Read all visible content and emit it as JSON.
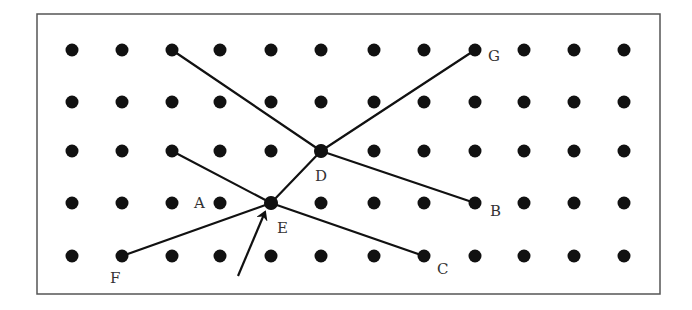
{
  "diagram": {
    "title": "",
    "colors": {
      "ink": "#111111",
      "frame": "#555555",
      "label": "#333333",
      "background": "#ffffff"
    },
    "frame": {
      "x": 37,
      "y": 14,
      "width": 623,
      "height": 280
    },
    "grid": {
      "columns_x": [
        72,
        122,
        172,
        220,
        271,
        321,
        374,
        424,
        475,
        524,
        574,
        624
      ],
      "rows_y": [
        50,
        102,
        151,
        203,
        256
      ],
      "dot_radius": 6.5
    },
    "junction_points": [
      {
        "name": "D",
        "x": 321,
        "y": 151
      },
      {
        "name": "E",
        "x": 271,
        "y": 203
      }
    ],
    "segments": [
      {
        "from": [
          172,
          50
        ],
        "to": [
          321,
          151
        ]
      },
      {
        "from": [
          475,
          50
        ],
        "to": [
          321,
          151
        ]
      },
      {
        "from": [
          321,
          151
        ],
        "to": [
          271,
          203
        ]
      },
      {
        "from": [
          321,
          151
        ],
        "to": [
          475,
          203
        ]
      },
      {
        "from": [
          172,
          151
        ],
        "to": [
          271,
          203
        ]
      },
      {
        "from": [
          122,
          256
        ],
        "to": [
          271,
          203
        ]
      },
      {
        "from": [
          271,
          203
        ],
        "to": [
          424,
          256
        ]
      }
    ],
    "arrow": {
      "from": [
        238,
        276
      ],
      "to": [
        265,
        212
      ]
    },
    "labels": [
      {
        "text": "G",
        "x": 488,
        "y": 61
      },
      {
        "text": "D",
        "x": 315,
        "y": 181
      },
      {
        "text": "B",
        "x": 490,
        "y": 216
      },
      {
        "text": "A",
        "x": 194,
        "y": 208
      },
      {
        "text": "E",
        "x": 277,
        "y": 233
      },
      {
        "text": "C",
        "x": 437,
        "y": 274
      },
      {
        "text": "F",
        "x": 110,
        "y": 283
      }
    ]
  }
}
